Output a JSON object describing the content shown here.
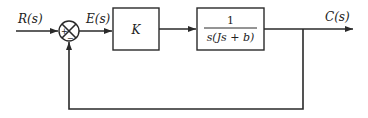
{
  "diagram": {
    "type": "feedback-control-block-diagram",
    "input_signal": "R(s)",
    "error_signal": "E(s)",
    "output_signal": "C(s)",
    "summing_junction": {
      "plus_sign": "+",
      "minus_sign": "−"
    },
    "controller_block": {
      "label": "K"
    },
    "plant_block": {
      "numerator": "1",
      "denominator": "s(Js + b)"
    },
    "feedback": "unity negative feedback"
  }
}
